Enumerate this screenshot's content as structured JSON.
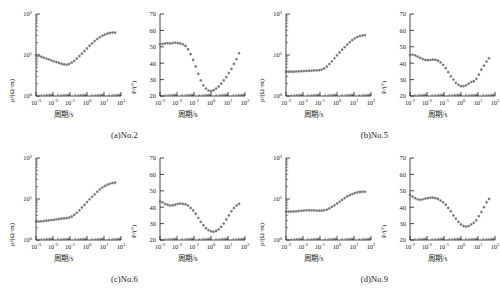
{
  "figure": {
    "type": "magnetotelluric-sounding-curves",
    "panel_count": 4,
    "marker_color": "#707070",
    "axis_color": "#1a1a1a"
  },
  "axes_common": {
    "x_label": "周期/s",
    "x_ticks": [
      "10-3",
      "10-2",
      "10-1",
      "100",
      "101",
      "102"
    ],
    "x_tick_mantissa": "10",
    "x_exponents": [
      "-3",
      "-2",
      "-1",
      "0",
      "1",
      "2"
    ],
    "x_range_log": [
      -3,
      2
    ],
    "rho_y_label": "ρ/(Ω·m)",
    "rho_y_ticks": [
      "100",
      "101",
      "102"
    ],
    "rho_y_exponents": [
      "0",
      "1",
      "2"
    ],
    "rho_y_range_log": [
      0,
      2
    ],
    "phase_y_label": "P/(°)",
    "phase_y_ticks": [
      "20",
      "30",
      "40",
      "50",
      "60",
      "70"
    ],
    "phase_y_range": [
      20,
      70
    ]
  },
  "panels": [
    {
      "id": "a",
      "caption": "(a)No.2",
      "station": "No.2",
      "resistivity": {
        "x": [
          -3.0,
          -2.85,
          -2.7,
          -2.55,
          -2.4,
          -2.25,
          -2.1,
          -1.95,
          -1.8,
          -1.65,
          -1.5,
          -1.35,
          -1.2,
          -1.05,
          -0.9,
          -0.75,
          -0.6,
          -0.45,
          -0.3,
          -0.15,
          0.0,
          0.15,
          0.3,
          0.45,
          0.6,
          0.75,
          0.9,
          1.05,
          1.2,
          1.35,
          1.5,
          1.65
        ],
        "y": [
          10.0,
          9.6,
          9.1,
          8.6,
          8.2,
          7.8,
          7.4,
          7.0,
          6.7,
          6.4,
          6.1,
          5.9,
          5.8,
          6.0,
          6.5,
          7.2,
          8.2,
          9.4,
          10.8,
          12.5,
          14.5,
          16.8,
          19.2,
          21.8,
          24.5,
          27.0,
          29.5,
          31.5,
          33.2,
          34.5,
          35.2,
          35.0
        ]
      },
      "phase": {
        "x": [
          -3.0,
          -2.85,
          -2.7,
          -2.55,
          -2.4,
          -2.25,
          -2.1,
          -1.95,
          -1.8,
          -1.65,
          -1.5,
          -1.35,
          -1.2,
          -1.05,
          -0.9,
          -0.75,
          -0.6,
          -0.45,
          -0.3,
          -0.15,
          0.0,
          0.15,
          0.3,
          0.45,
          0.6,
          0.75,
          0.9,
          1.05,
          1.2,
          1.35,
          1.5,
          1.65
        ],
        "y": [
          51.5,
          51.8,
          52.0,
          52.2,
          52.0,
          52.3,
          52.5,
          52.2,
          52.0,
          51.5,
          50.5,
          48.5,
          45.5,
          42.0,
          38.0,
          33.5,
          29.5,
          26.5,
          24.5,
          23.3,
          23.0,
          23.5,
          24.5,
          25.8,
          27.5,
          29.5,
          31.5,
          34.0,
          36.5,
          39.5,
          42.5,
          46.0
        ]
      }
    },
    {
      "id": "b",
      "caption": "(b)No.5",
      "station": "No.5",
      "resistivity": {
        "x": [
          -3.0,
          -2.85,
          -2.7,
          -2.55,
          -2.4,
          -2.25,
          -2.1,
          -1.95,
          -1.8,
          -1.65,
          -1.5,
          -1.35,
          -1.2,
          -1.05,
          -0.9,
          -0.75,
          -0.6,
          -0.45,
          -0.3,
          -0.15,
          0.0,
          0.15,
          0.3,
          0.45,
          0.6,
          0.75,
          0.9,
          1.05,
          1.2,
          1.35,
          1.5,
          1.65
        ],
        "y": [
          3.9,
          3.9,
          3.9,
          3.9,
          3.95,
          4.0,
          4.0,
          4.05,
          4.1,
          4.1,
          4.15,
          4.2,
          4.2,
          4.25,
          4.4,
          4.7,
          5.2,
          6.0,
          7.0,
          8.3,
          9.8,
          11.5,
          13.5,
          15.5,
          18.0,
          20.5,
          23.0,
          25.5,
          27.5,
          29.0,
          30.0,
          30.5
        ]
      },
      "phase": {
        "x": [
          -3.0,
          -2.85,
          -2.7,
          -2.55,
          -2.4,
          -2.25,
          -2.1,
          -1.95,
          -1.8,
          -1.65,
          -1.5,
          -1.35,
          -1.2,
          -1.05,
          -0.9,
          -0.75,
          -0.6,
          -0.45,
          -0.3,
          -0.15,
          0.0,
          0.15,
          0.3,
          0.45,
          0.6,
          0.75,
          0.9,
          1.05,
          1.2,
          1.35,
          1.5,
          1.65
        ],
        "y": [
          45.0,
          45.2,
          44.8,
          44.0,
          43.2,
          42.5,
          42.0,
          41.8,
          42.0,
          42.2,
          42.0,
          41.5,
          40.5,
          39.0,
          37.0,
          34.5,
          32.0,
          30.0,
          28.0,
          26.8,
          26.0,
          26.0,
          26.5,
          27.5,
          28.5,
          29.0,
          30.5,
          33.0,
          36.0,
          38.5,
          41.0,
          43.0
        ]
      }
    },
    {
      "id": "c",
      "caption": "(c)No.6",
      "station": "No.6",
      "resistivity": {
        "x": [
          -3.0,
          -2.85,
          -2.7,
          -2.55,
          -2.4,
          -2.25,
          -2.1,
          -1.95,
          -1.8,
          -1.65,
          -1.5,
          -1.35,
          -1.2,
          -1.05,
          -0.9,
          -0.75,
          -0.6,
          -0.45,
          -0.3,
          -0.15,
          0.0,
          0.15,
          0.3,
          0.45,
          0.6,
          0.75,
          0.9,
          1.05,
          1.2,
          1.35,
          1.5,
          1.65
        ],
        "y": [
          2.8,
          2.8,
          2.85,
          2.9,
          2.95,
          3.0,
          3.05,
          3.1,
          3.2,
          3.25,
          3.3,
          3.35,
          3.4,
          3.5,
          3.7,
          4.1,
          4.6,
          5.3,
          6.2,
          7.2,
          8.4,
          9.8,
          11.3,
          13.0,
          15.0,
          17.0,
          19.0,
          20.8,
          22.3,
          23.5,
          24.5,
          25.0
        ]
      },
      "phase": {
        "x": [
          -3.0,
          -2.85,
          -2.7,
          -2.55,
          -2.4,
          -2.25,
          -2.1,
          -1.95,
          -1.8,
          -1.65,
          -1.5,
          -1.35,
          -1.2,
          -1.05,
          -0.9,
          -0.75,
          -0.6,
          -0.45,
          -0.3,
          -0.15,
          0.0,
          0.15,
          0.3,
          0.45,
          0.6,
          0.75,
          0.9,
          1.05,
          1.2,
          1.35,
          1.5,
          1.65
        ],
        "y": [
          43.5,
          43.0,
          42.0,
          41.5,
          41.0,
          41.2,
          41.5,
          42.0,
          42.2,
          42.0,
          41.8,
          41.0,
          39.5,
          38.0,
          36.0,
          33.5,
          31.0,
          29.0,
          27.2,
          26.0,
          25.3,
          25.0,
          25.5,
          26.5,
          28.0,
          30.0,
          32.5,
          35.0,
          37.5,
          39.5,
          41.0,
          42.0
        ]
      }
    },
    {
      "id": "d",
      "caption": "(d)No.9",
      "station": "No.9",
      "resistivity": {
        "x": [
          -3.0,
          -2.85,
          -2.7,
          -2.55,
          -2.4,
          -2.25,
          -2.1,
          -1.95,
          -1.8,
          -1.65,
          -1.5,
          -1.35,
          -1.2,
          -1.05,
          -0.9,
          -0.75,
          -0.6,
          -0.45,
          -0.3,
          -0.15,
          0.0,
          0.15,
          0.3,
          0.45,
          0.6,
          0.75,
          0.9,
          1.05,
          1.2,
          1.35,
          1.5,
          1.65
        ],
        "y": [
          4.9,
          4.9,
          4.9,
          4.95,
          5.0,
          5.1,
          5.15,
          5.2,
          5.3,
          5.3,
          5.3,
          5.25,
          5.2,
          5.2,
          5.2,
          5.3,
          5.5,
          5.9,
          6.4,
          7.0,
          7.8,
          8.6,
          9.5,
          10.5,
          11.5,
          12.4,
          13.2,
          14.0,
          14.5,
          14.8,
          15.0,
          15.0
        ]
      },
      "phase": {
        "x": [
          -3.0,
          -2.85,
          -2.7,
          -2.55,
          -2.4,
          -2.25,
          -2.1,
          -1.95,
          -1.8,
          -1.65,
          -1.5,
          -1.35,
          -1.2,
          -1.05,
          -0.9,
          -0.75,
          -0.6,
          -0.45,
          -0.3,
          -0.15,
          0.0,
          0.15,
          0.3,
          0.45,
          0.6,
          0.75,
          0.9,
          1.05,
          1.2,
          1.35,
          1.5,
          1.65
        ],
        "y": [
          47.5,
          46.5,
          45.5,
          44.8,
          44.5,
          44.8,
          45.2,
          45.5,
          45.8,
          45.8,
          45.5,
          45.0,
          44.0,
          43.0,
          41.5,
          39.5,
          37.5,
          35.0,
          33.0,
          31.0,
          29.5,
          28.5,
          28.2,
          28.5,
          29.5,
          30.5,
          32.0,
          34.5,
          37.0,
          40.0,
          43.0,
          45.0
        ]
      }
    }
  ],
  "chart_data": {
    "type": "scatter",
    "title": "",
    "subplot_grid": [
      2,
      2
    ],
    "subplots_per_panel": 2,
    "xlabel": "周期/s",
    "ylabel_left": "ρ/(Ω·m)",
    "ylabel_right": "P/(°)",
    "xscale": "log",
    "yscale_left": "log",
    "yscale_right": "linear",
    "xlim": [
      0.001,
      100
    ],
    "ylim_left": [
      1,
      100
    ],
    "ylim_right": [
      20,
      70
    ],
    "grid": false,
    "legend": "none",
    "panel_labels": [
      "(a)No.2",
      "(b)No.5",
      "(c)No.6",
      "(d)No.9"
    ]
  }
}
